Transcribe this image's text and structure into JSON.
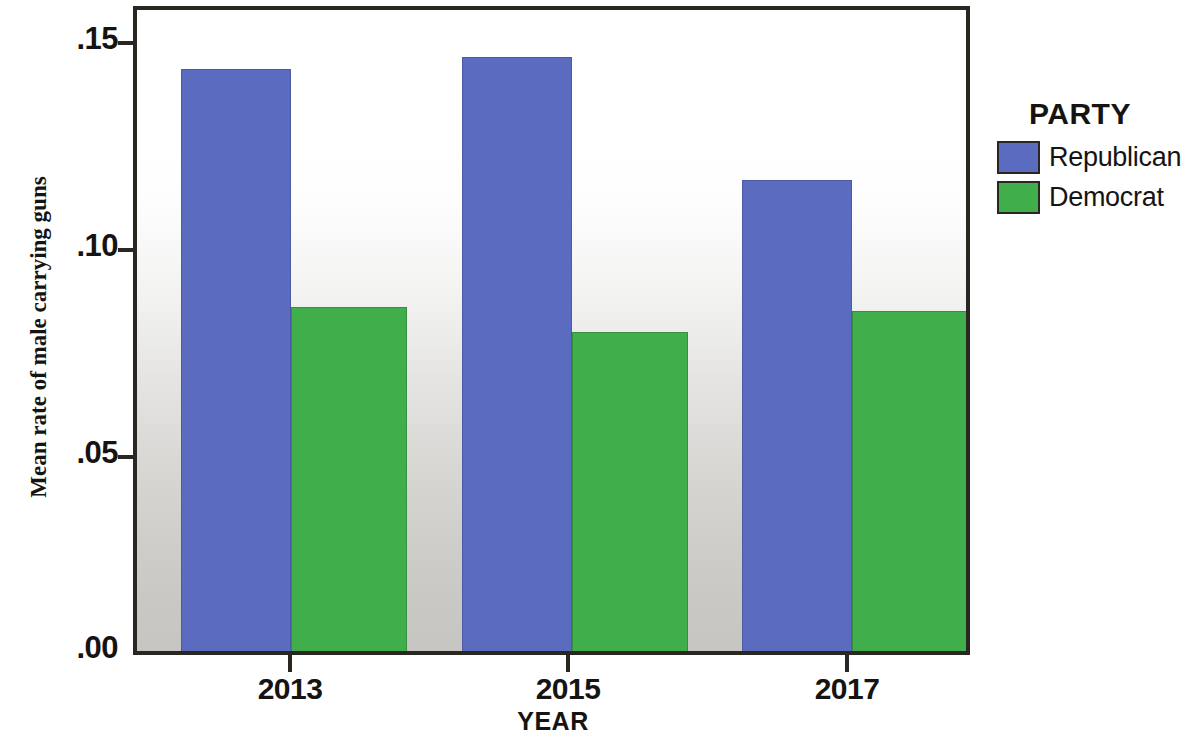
{
  "chart_data": {
    "type": "bar",
    "title": "",
    "xlabel": "YEAR",
    "ylabel": "Mean rate of male carrying guns",
    "categories": [
      "2013",
      "2015",
      "2017"
    ],
    "series": [
      {
        "name": "Republican",
        "color": "#5a6bc0",
        "values": [
          0.142,
          0.145,
          0.115
        ]
      },
      {
        "name": "Democrat",
        "color": "#3fae4b",
        "values": [
          0.084,
          0.078,
          0.083
        ]
      }
    ],
    "ylim": [
      0.0,
      0.1565
    ],
    "ytick_values": [
      0.0,
      0.05,
      0.1,
      0.15
    ],
    "ytick_labels": [
      ".00",
      ".05",
      ".10",
      ".15"
    ],
    "grid": false,
    "legend_position": "right",
    "legend_title": "PARTY"
  },
  "legend": {
    "title": "PARTY",
    "entries": [
      {
        "label": "Republican",
        "color": "#5a6bc0"
      },
      {
        "label": "Democrat",
        "color": "#3fae4b"
      }
    ]
  },
  "axes": {
    "x_title": "YEAR",
    "y_title": "Mean rate of male carrying guns",
    "x_labels": [
      "2013",
      "2015",
      "2017"
    ],
    "y_labels": [
      ".15",
      ".10",
      ".05",
      ".00"
    ]
  }
}
